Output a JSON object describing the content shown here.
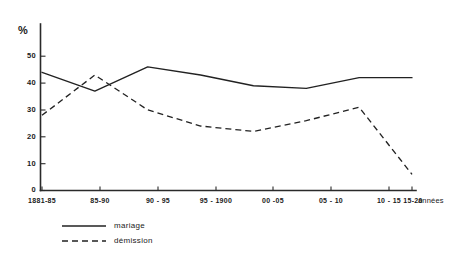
{
  "chart_data": {
    "type": "line",
    "title": "",
    "xlabel": "années",
    "ylabel": "%",
    "ylim": [
      0,
      55
    ],
    "yticks": [
      0,
      10,
      20,
      30,
      40,
      50
    ],
    "ytick_labels": [
      "0",
      "10",
      "20",
      "30",
      "40",
      "50"
    ],
    "grid": false,
    "legend_position": "bottom-left",
    "categories": [
      "1881-85",
      "85-90",
      "90 - 95",
      "95 - 1900",
      "00 -05",
      "05 - 10",
      "10 - 15",
      "15-20"
    ],
    "series": [
      {
        "name": "mariage",
        "style": "solid",
        "values": [
          44,
          37,
          46,
          43,
          39,
          38,
          42,
          42
        ]
      },
      {
        "name": "démission",
        "style": "dashed",
        "values": [
          28,
          43,
          30,
          24,
          22,
          26,
          31,
          6
        ]
      }
    ]
  },
  "axis": {
    "y_unit": "%",
    "x_unit": "années"
  },
  "legend": {
    "items": [
      {
        "label": "mariage",
        "style": "solid"
      },
      {
        "label": "démission",
        "style": "dashed"
      }
    ]
  }
}
